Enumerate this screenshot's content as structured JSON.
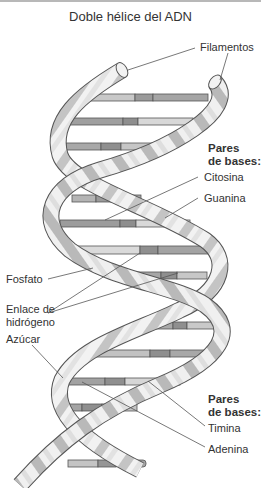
{
  "title": "Doble hélice del ADN",
  "labels": {
    "filamentos": "Filamentos",
    "pares_bases_1_line1": "Pares",
    "pares_bases_1_line2": "de bases:",
    "citosina": "Citosina",
    "guanina": "Guanina",
    "fosfato": "Fosfato",
    "enlace_line1": "Enlace de",
    "enlace_line2": "hidrógeno",
    "azucar": "Azúcar",
    "pares_bases_2_line1": "Pares",
    "pares_bases_2_line2": "de bases:",
    "timina": "Timina",
    "adenina": "Adenina"
  },
  "colors": {
    "background": "#ffffff",
    "ribbon_light": "#f2f2f2",
    "ribbon_mid": "#c8c8c8",
    "ribbon_dark": "#a9a9a9",
    "outline": "#555555",
    "base_dark": "#9a9a9a",
    "base_mid": "#b5b5b5",
    "base_light": "#dcdcdc",
    "leader_line": "#555555"
  }
}
